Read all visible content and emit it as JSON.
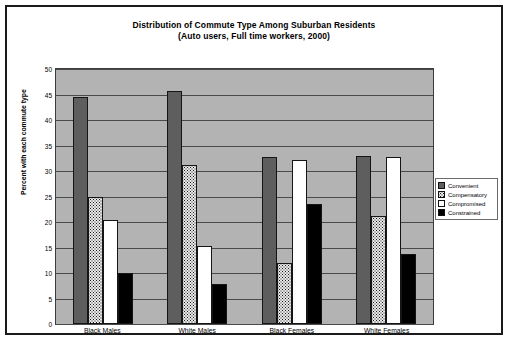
{
  "chart_data": {
    "type": "bar",
    "title": "Distribution of Commute Type Among Suburban Residents",
    "subtitle": "(Auto users, Full time workers, 2000)",
    "xlabel": "",
    "ylabel": "Percent with each commute type",
    "ylim": [
      0,
      50
    ],
    "ytick_step": 5,
    "yticks": [
      50,
      45,
      40,
      35,
      30,
      25,
      20,
      15,
      10,
      5,
      0
    ],
    "grid": true,
    "legend_position": "right",
    "categories": [
      "Black Males",
      "White Males",
      "Black Females",
      "White Females"
    ],
    "series": [
      {
        "name": "Convenient",
        "values": [
          44.6,
          45.6,
          32.8,
          33.0
        ],
        "color": "#5e5e5e",
        "pattern": "solid-dark-gray"
      },
      {
        "name": "Compensatory",
        "values": [
          25.0,
          31.2,
          12.0,
          21.2
        ],
        "color": "#e9e9e9",
        "pattern": "speckled"
      },
      {
        "name": "Compromised",
        "values": [
          20.4,
          15.2,
          32.2,
          32.8
        ],
        "color": "#ffffff",
        "pattern": "white"
      },
      {
        "name": "Constrained",
        "values": [
          10.0,
          7.8,
          23.6,
          13.8
        ],
        "color": "#000000",
        "pattern": "solid-black"
      }
    ],
    "plot_background": "#b3b3b3"
  },
  "legend": {
    "items": [
      {
        "label": "Convenient"
      },
      {
        "label": "Compensatory"
      },
      {
        "label": "Compromised"
      },
      {
        "label": "Constrained"
      }
    ]
  }
}
